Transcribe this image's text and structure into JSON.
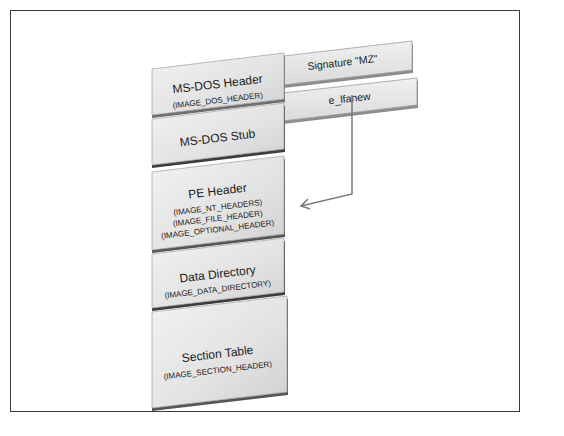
{
  "diagram": {
    "blocks": [
      {
        "id": "dos-header",
        "title": "MS-DOS Header",
        "subtitles": [
          "(IMAGE_DOS_HEADER)"
        ]
      },
      {
        "id": "dos-stub",
        "title": "MS-DOS Stub",
        "subtitles": []
      },
      {
        "id": "pe-header",
        "title": "PE Header",
        "subtitles": [
          "(IMAGE_NT_HEADERS)",
          "(IMAGE_FILE_HEADER)",
          "(IMAGE_OPTIONAL_HEADER)"
        ]
      },
      {
        "id": "data-directory",
        "title": "Data Directory",
        "subtitles": [
          "(IMAGE_DATA_DIRECTORY)"
        ]
      },
      {
        "id": "section-table",
        "title": "Section Table",
        "subtitles": [
          "(IMAGE_SECTION_HEADER)"
        ]
      }
    ],
    "fields": [
      {
        "id": "signature",
        "label": "Signature \"MZ\""
      },
      {
        "id": "e-lfanew",
        "label": "e_lfanew"
      }
    ],
    "arrow": {
      "from": "e_lfanew",
      "to": "PE Header"
    },
    "colors": {
      "block_face": "#e4e4e4",
      "block_shadow": "#6e6e6e",
      "arrow": "#7a7a7a",
      "border": "#3a3a3a"
    }
  }
}
